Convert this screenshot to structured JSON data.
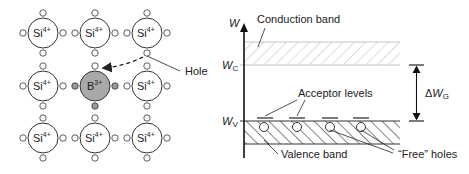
{
  "lattice": {
    "host_atom": "Si",
    "host_charge": "4+",
    "dopant_atom": "B",
    "dopant_charge": "3+",
    "hole_label": "Hole",
    "grid": [
      [
        "Si",
        "Si",
        "Si"
      ],
      [
        "Si",
        "B",
        "Si"
      ],
      [
        "Si",
        "Si",
        "Si"
      ]
    ]
  },
  "band_diagram": {
    "axis_label": "W",
    "wc_label": "W",
    "wc_sub": "C",
    "wv_label": "W",
    "wv_sub": "V",
    "conduction_band": "Conduction band",
    "valence_band": "Valence band",
    "acceptor_levels": "Acceptor levels",
    "free_holes": "“Free” holes",
    "gap_delta": "Δ",
    "gap_w": "W",
    "gap_sub": "G"
  },
  "colors": {
    "line": "#222222",
    "dopant_fill": "#a9a9a9",
    "hatch_light": "#bdbdbd",
    "hatch_dark": "#333333"
  }
}
